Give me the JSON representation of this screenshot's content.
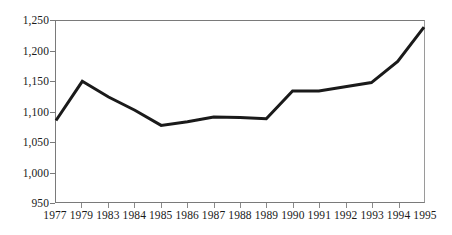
{
  "chart_data": {
    "type": "line",
    "title": "",
    "subtitle": "",
    "xlabel": "",
    "ylabel": "",
    "categories": [
      "1977",
      "1979",
      "1983",
      "1984",
      "1985",
      "1986",
      "1987",
      "1988",
      "1989",
      "1990",
      "1991",
      "1992",
      "1993",
      "1994",
      "1995"
    ],
    "values": [
      1085,
      1150,
      1124,
      1102,
      1077,
      1083,
      1091,
      1090,
      1088,
      1134,
      1134,
      1141,
      1148,
      1183,
      1240
    ],
    "series": [
      {
        "name": "",
        "values": [
          1085,
          1150,
          1124,
          1102,
          1077,
          1083,
          1091,
          1090,
          1088,
          1134,
          1134,
          1141,
          1148,
          1183,
          1240
        ]
      }
    ],
    "ylim": [
      950,
      1250
    ],
    "ytick_values": [
      1250,
      1200,
      1150,
      1100,
      1050,
      1000,
      950
    ],
    "ytick_labels": [
      "1,250",
      "1,200",
      "1,150",
      "1,100",
      "1,050",
      "1,000",
      "950"
    ],
    "xtick_labels": [
      "1977",
      "1979",
      "1983",
      "1984",
      "1985",
      "1986",
      "1987",
      "1988",
      "1989",
      "1990",
      "1991",
      "1992",
      "1993",
      "1994",
      "1995"
    ],
    "grid": false,
    "legend": false,
    "legend_position": "none",
    "annotations": [],
    "line_color": "#1a1a1a",
    "line_width": 3,
    "background_color": "#ffffff",
    "axis_color": "#7a7a7a"
  }
}
